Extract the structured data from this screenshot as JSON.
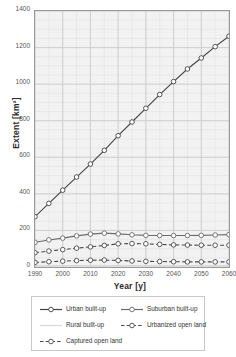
{
  "chart_data": {
    "type": "line",
    "title": "",
    "xlabel": "Year [y]",
    "ylabel": "Extent [km²]",
    "xlim": [
      1990,
      2060
    ],
    "ylim": [
      0,
      1400
    ],
    "xticks": [
      1990,
      2000,
      2010,
      2020,
      2030,
      2040,
      2050,
      2060
    ],
    "yticks": [
      0,
      200,
      400,
      600,
      800,
      1000,
      1200,
      1400
    ],
    "grid": true,
    "minor_grid": true,
    "legend_position": "below",
    "x": [
      1990,
      1995,
      2000,
      2005,
      2010,
      2015,
      2020,
      2025,
      2030,
      2035,
      2040,
      2045,
      2050,
      2055,
      2060
    ],
    "series": [
      {
        "name": "Urban built-up",
        "style": "solid",
        "color": "#444444",
        "marker": "circle-open",
        "values": [
          275,
          348,
          420,
          492,
          563,
          638,
          718,
          793,
          868,
          943,
          1014,
          1083,
          1143,
          1205,
          1262
        ]
      },
      {
        "name": "Suburban built-up",
        "style": "solid",
        "color": "#6b6b6b",
        "marker": "circle-open",
        "values": [
          135,
          148,
          158,
          170,
          180,
          185,
          181,
          176,
          173,
          172,
          172,
          172,
          173,
          175,
          177
        ]
      },
      {
        "name": "Rural built-up",
        "style": "solid",
        "color": "#d8d8d8",
        "marker": "none",
        "values": [
          8,
          8,
          8,
          8,
          8,
          8,
          8,
          8,
          8,
          8,
          8,
          8,
          8,
          8,
          8
        ]
      },
      {
        "name": "Urbanized open land",
        "style": "dashed",
        "color": "#4a4a4a",
        "marker": "circle-open",
        "values": [
          78,
          87,
          95,
          103,
          110,
          118,
          127,
          128,
          127,
          124,
          121,
          120,
          119,
          119,
          119
        ]
      },
      {
        "name": "Captured open land",
        "style": "dashed",
        "color": "#4a4a4a",
        "marker": "circle-open",
        "values": [
          25,
          29,
          32,
          35,
          37,
          38,
          36,
          33,
          31,
          30,
          29,
          28,
          28,
          28,
          28
        ]
      }
    ]
  },
  "legend": {
    "items": [
      {
        "label": "Urban built-up",
        "style": "solid",
        "color": "#444444",
        "marker": "circle-open"
      },
      {
        "label": "Suburban built-up",
        "style": "solid",
        "color": "#6b6b6b",
        "marker": "circle-open"
      },
      {
        "label": "Rural built-up",
        "style": "solid",
        "color": "#d8d8d8",
        "marker": "none"
      },
      {
        "label": "Urbanized open land",
        "style": "dashed",
        "color": "#4a4a4a",
        "marker": "circle-open"
      },
      {
        "label": "Captured open land",
        "style": "dashed",
        "color": "#4a4a4a",
        "marker": "circle-open"
      }
    ]
  },
  "colors": {
    "plot_background": "#f2f2f2",
    "major_grid": "#c9c9c9",
    "minor_grid": "#e2e2e2",
    "axis": "#333333",
    "tick_text": "#555555"
  }
}
